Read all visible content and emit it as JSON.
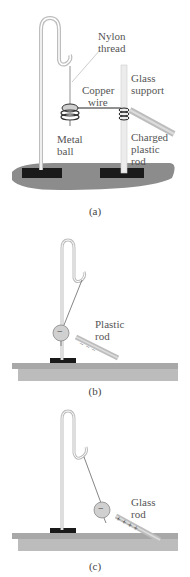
{
  "figure": {
    "panels": [
      {
        "id": "a",
        "caption": "(a)",
        "labels": {
          "nylon_line1": "Nylon",
          "nylon_line2": "thread",
          "glass_line1": "Glass",
          "glass_line2": "support",
          "copper_line1": "Copper",
          "copper_line2": "wire",
          "metal_line1": "Metal",
          "metal_line2": "ball",
          "charged_line1": "Charged",
          "charged_line2": "plastic",
          "charged_line3": "rod"
        }
      },
      {
        "id": "b",
        "caption": "(b)",
        "labels": {
          "rod_line1": "Plastic",
          "rod_line2": "rod"
        },
        "ball_charge": "−",
        "rod_charges": "− − −"
      },
      {
        "id": "c",
        "caption": "(c)",
        "labels": {
          "rod_line1": "Glass",
          "rod_line2": "rod"
        },
        "ball_charge": "−",
        "rod_charges": "+ + + +"
      }
    ],
    "colors": {
      "stand": "#b8b8b8",
      "base_block": "#1a1a1a",
      "table_a": "#8c8c8c",
      "table_bc": "#a8a8a8",
      "rod": "#c8c8c8",
      "text": "#555555"
    }
  }
}
